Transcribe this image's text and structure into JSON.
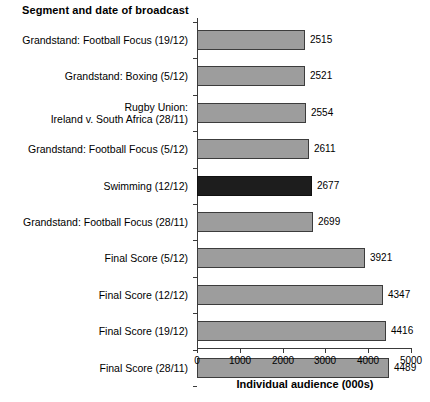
{
  "chart_data": {
    "type": "bar",
    "orientation": "horizontal",
    "title": "Segment and date of broadcast",
    "xlabel": "Individual audience (000s)",
    "ylabel": "",
    "xlim": [
      0,
      5000
    ],
    "xticks": [
      0,
      1000,
      2000,
      3000,
      4000,
      5000
    ],
    "xtick_labels": [
      "0",
      "1000",
      "2000",
      "3000",
      "4000",
      "5000"
    ],
    "grid": false,
    "legend": "none",
    "categories": [
      "Grandstand: Football Focus (19/12)",
      "Grandstand: Boxing (5/12)",
      "Rugby Union:\nIreland v. South Africa (28/11)",
      "Grandstand: Football Focus (5/12)",
      "Swimming (12/12)",
      "Grandstand: Football Focus (28/11)",
      "Final Score (5/12)",
      "Final Score (12/12)",
      "Final Score (19/12)",
      "Final Score (28/11)"
    ],
    "values": [
      2515,
      2521,
      2554,
      2611,
      2677,
      2699,
      3921,
      4347,
      4416,
      4489
    ],
    "value_labels": [
      "2515",
      "2521",
      "2554",
      "2611",
      "2677",
      "2699",
      "3921",
      "4347",
      "4416",
      "4489"
    ],
    "highlighted_category": "Swimming (12/12)",
    "highlighted_index": 4,
    "colors": {
      "bar_fill": "#9d9d9d",
      "bar_border": "#3c3c3c",
      "highlight_fill": "#1d1d1d",
      "axis": "#3a3a3a",
      "text": "#000000",
      "background": "#ffffff"
    }
  }
}
